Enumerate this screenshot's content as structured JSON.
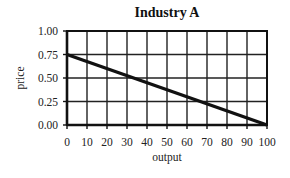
{
  "chart_data": {
    "type": "line",
    "title": "Industry A",
    "xlabel": "output",
    "ylabel": "price",
    "xlim": [
      0,
      100
    ],
    "ylim": [
      0,
      1
    ],
    "x_ticks": [
      0,
      10,
      20,
      30,
      40,
      50,
      60,
      70,
      80,
      90,
      100
    ],
    "x_tick_labels": [
      "0",
      "10",
      "20",
      "30",
      "40",
      "50",
      "60",
      "70",
      "80",
      "90",
      "100"
    ],
    "y_ticks": [
      0,
      0.25,
      0.5,
      0.75,
      1.0
    ],
    "y_tick_labels": [
      "0.00",
      "0.25",
      "0.50",
      "0.75",
      "1.00"
    ],
    "grid": true,
    "legend": null,
    "series": [
      {
        "name": "demand",
        "x": [
          0,
          100
        ],
        "y": [
          0.75,
          0
        ],
        "color": "#111111"
      }
    ]
  }
}
